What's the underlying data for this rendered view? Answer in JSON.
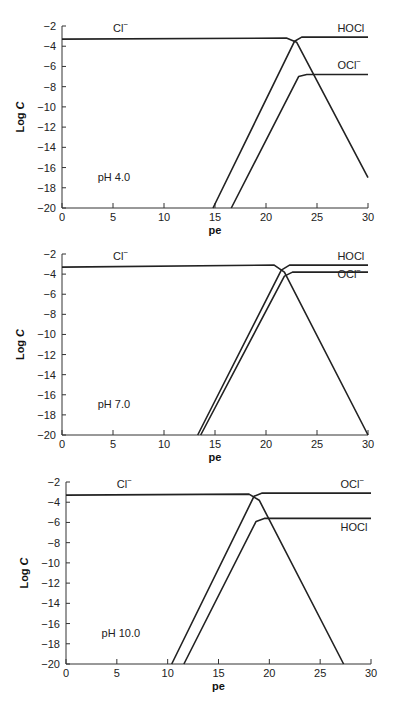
{
  "chart_data": [
    {
      "type": "line",
      "title": "pH 4.0",
      "xlabel": "pe",
      "ylabel": "Log C",
      "xlim": [
        0,
        30
      ],
      "ylim": [
        -20,
        -2
      ],
      "xticks": [
        0,
        5,
        10,
        15,
        20,
        25,
        30
      ],
      "yticks": [
        -2,
        -4,
        -6,
        -8,
        -10,
        -12,
        -14,
        -16,
        -18,
        -20
      ],
      "annotation": "pH 4.0",
      "series": [
        {
          "name": "Cl⁻",
          "x": [
            0,
            22,
            23,
            30
          ],
          "y": [
            -3.3,
            -3.2,
            -3.6,
            -17
          ]
        },
        {
          "name": "HOCl",
          "x": [
            14.8,
            22.8,
            23.5,
            30
          ],
          "y": [
            -20,
            -3.5,
            -3.1,
            -3.1
          ]
        },
        {
          "name": "OCl⁻",
          "x": [
            16.6,
            23.2,
            24,
            30
          ],
          "y": [
            -20,
            -7.0,
            -6.8,
            -6.8
          ]
        }
      ],
      "labels": [
        {
          "text": "Cl⁻",
          "x": 5,
          "y": -2.6
        },
        {
          "text": "HOCl",
          "x": 27,
          "y": -2.6
        },
        {
          "text": "OCl⁻",
          "x": 27,
          "y": -6.3
        }
      ]
    },
    {
      "type": "line",
      "title": "pH 7.0",
      "xlabel": "pe",
      "ylabel": "Log C",
      "xlim": [
        0,
        30
      ],
      "ylim": [
        -20,
        -2
      ],
      "xticks": [
        0,
        5,
        10,
        15,
        20,
        25,
        30
      ],
      "yticks": [
        -2,
        -4,
        -6,
        -8,
        -10,
        -12,
        -14,
        -16,
        -18,
        -20
      ],
      "annotation": "pH 7.0",
      "series": [
        {
          "name": "Cl⁻",
          "x": [
            0,
            20.8,
            21.8,
            30
          ],
          "y": [
            -3.3,
            -3.1,
            -3.8,
            -20
          ]
        },
        {
          "name": "HOCl",
          "x": [
            13.3,
            21.5,
            22.3,
            30
          ],
          "y": [
            -20,
            -3.6,
            -3.1,
            -3.1
          ]
        },
        {
          "name": "OCl⁻",
          "x": [
            13.6,
            21.8,
            22.6,
            30
          ],
          "y": [
            -20,
            -4.2,
            -3.8,
            -3.8
          ]
        }
      ],
      "labels": [
        {
          "text": "Cl⁻",
          "x": 5,
          "y": -2.6
        },
        {
          "text": "HOCl",
          "x": 27,
          "y": -2.6
        },
        {
          "text": "OCl⁻",
          "x": 27,
          "y": -4.4
        }
      ]
    },
    {
      "type": "line",
      "title": "pH 10.0",
      "xlabel": "pe",
      "ylabel": "Log C",
      "xlim": [
        0,
        30
      ],
      "ylim": [
        -20,
        -2
      ],
      "xticks": [
        0,
        5,
        10,
        15,
        20,
        25,
        30
      ],
      "yticks": [
        -2,
        -4,
        -6,
        -8,
        -10,
        -12,
        -14,
        -16,
        -18,
        -20
      ],
      "annotation": "pH 10.0",
      "series": [
        {
          "name": "Cl⁻",
          "x": [
            0,
            18,
            19,
            27.3
          ],
          "y": [
            -3.3,
            -3.2,
            -3.8,
            -20
          ]
        },
        {
          "name": "OCl⁻",
          "x": [
            10.4,
            18.5,
            19.3,
            30
          ],
          "y": [
            -20,
            -3.4,
            -3.1,
            -3.1
          ]
        },
        {
          "name": "HOCl",
          "x": [
            11.6,
            18.7,
            19.5,
            30
          ],
          "y": [
            -20,
            -5.9,
            -5.6,
            -5.6
          ]
        }
      ],
      "labels": [
        {
          "text": "Cl⁻",
          "x": 5,
          "y": -2.6
        },
        {
          "text": "OCl⁻",
          "x": 27,
          "y": -2.6
        },
        {
          "text": "HOCl",
          "x": 27,
          "y": -6.8
        }
      ]
    }
  ],
  "layout": [
    {
      "x0": 62,
      "x30": 368,
      "yTop": 26,
      "yBot": 208,
      "xlabelY": 234
    },
    {
      "x0": 62,
      "x30": 368,
      "yTop": 254,
      "yBot": 435,
      "xlabelY": 461
    },
    {
      "x0": 66,
      "x30": 371,
      "yTop": 482,
      "yBot": 664,
      "xlabelY": 690
    }
  ]
}
